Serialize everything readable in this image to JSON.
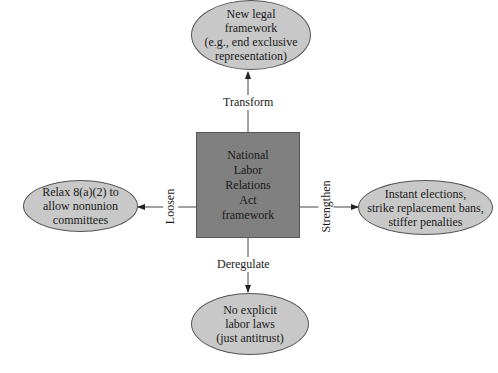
{
  "diagram": {
    "center": {
      "lines": [
        "National",
        "Labor",
        "Relations",
        "Act",
        "framework"
      ]
    },
    "nodes": {
      "top": {
        "lines": [
          "New legal",
          "framework",
          "(e.g., end exclusive",
          "representation)"
        ]
      },
      "left": {
        "lines": [
          "Relax 8(a)(2) to",
          "allow nonunion",
          "committees"
        ]
      },
      "right": {
        "lines": [
          "Instant elections,",
          "strike replacement bans,",
          "stiffer penalties"
        ]
      },
      "bottom": {
        "lines": [
          "No explicit",
          "labor laws",
          "(just antitrust)"
        ]
      }
    },
    "edges": {
      "top": "Transform",
      "left": "Loosen",
      "right": "Strengthen",
      "bottom": "Deregulate"
    },
    "colors": {
      "center_fill": "#808080",
      "ellipse_fill": "#c8c8c8",
      "stroke": "#555555"
    }
  }
}
